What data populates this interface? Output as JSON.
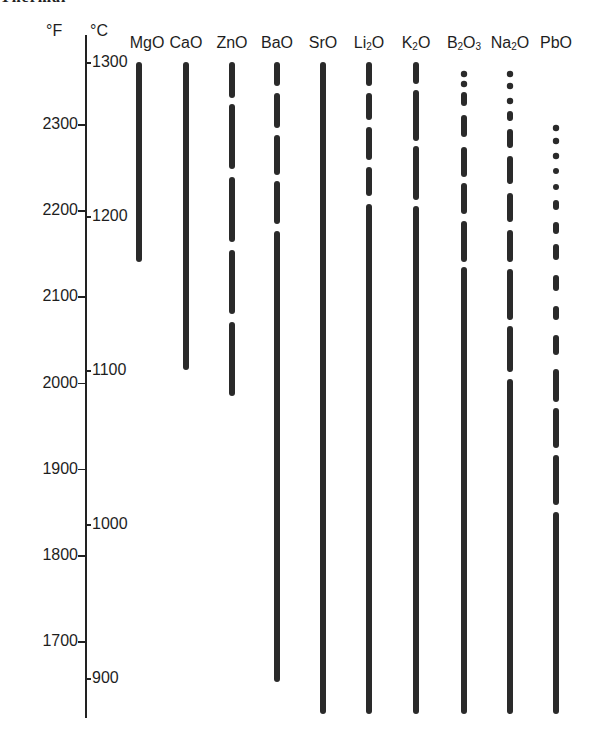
{
  "header": {
    "cutoff_text": "Thermal"
  },
  "axes": {
    "fahrenheit": {
      "unit": "°F",
      "ticks": [
        2300,
        2200,
        2100,
        2000,
        1900,
        1800,
        1700
      ]
    },
    "celsius": {
      "unit": "°C",
      "ticks": [
        1300,
        1200,
        1100,
        1000,
        900
      ]
    }
  },
  "oxides": [
    {
      "label": "MgO",
      "html": "MgO"
    },
    {
      "label": "CaO",
      "html": "CaO"
    },
    {
      "label": "ZnO",
      "html": "ZnO"
    },
    {
      "label": "BaO",
      "html": "BaO"
    },
    {
      "label": "SrO",
      "html": "SrO"
    },
    {
      "label": "Li2O",
      "html": "Li<sub>2</sub>O"
    },
    {
      "label": "K2O",
      "html": "K<sub>2</sub>O"
    },
    {
      "label": "B2O3",
      "html": "B<sub>2</sub>O<sub>3</sub>"
    },
    {
      "label": "Na2O",
      "html": "Na<sub>2</sub>O"
    },
    {
      "label": "PbO",
      "html": "PbO"
    }
  ],
  "colors": {
    "ink": "#1e1e1e",
    "bar": "#2a2a2a",
    "background": "#ffffff"
  },
  "chart_data": {
    "type": "bar",
    "subtype": "range-bars (vertical, temperature ranges)",
    "title": "",
    "xlabel": "",
    "ylabel": "Temperature (°F left scale, °C right scale)",
    "categories": [
      "MgO",
      "CaO",
      "ZnO",
      "BaO",
      "SrO",
      "Li2O",
      "K2O",
      "B2O3",
      "Na2O",
      "PbO"
    ],
    "series": [
      {
        "name": "top (°C)",
        "values": [
          1300,
          1300,
          1300,
          1300,
          1300,
          1300,
          1300,
          1293,
          1293,
          1258
        ]
      },
      {
        "name": "bottom (°C)",
        "values": [
          1170,
          1100,
          1083,
          898,
          877,
          877,
          877,
          877,
          877,
          877
        ]
      },
      {
        "name": "top (°F)",
        "values": [
          2372,
          2372,
          2372,
          2372,
          2372,
          2372,
          2372,
          2360,
          2360,
          2296
        ]
      },
      {
        "name": "bottom (°F)",
        "values": [
          2138,
          2012,
          1981,
          1648,
          1611,
          1611,
          1611,
          1611,
          1611,
          1611
        ]
      }
    ],
    "line_styles": {
      "MgO": "solid",
      "CaO": "solid",
      "ZnO": "long dashes",
      "BaO": "dashed at top, solid below ~1180°C",
      "SrO": "solid",
      "Li2O": "dashed at top, solid below ~1205°C",
      "K2O": "dashed at top, solid below ~1205°C",
      "B2O3": "dotted at top, dashed, solid below ~1140°C",
      "Na2O": "dotted at top, dashed, solid below ~1080°C",
      "PbO": "dotted at top, dashed, solid below ~1020°C"
    },
    "ylim_F": [
      1610,
      2380
    ],
    "ylim_C": [
      877,
      1305
    ],
    "grid": false,
    "legend": "none (categories labeled above bars)"
  }
}
